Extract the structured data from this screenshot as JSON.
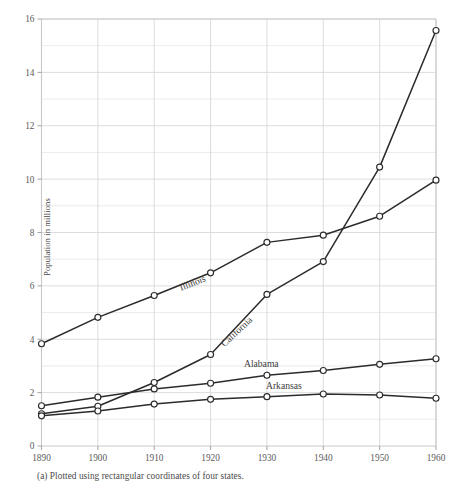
{
  "figure": {
    "caption": "(a)  Plotted using rectangular coordinates of four states.",
    "y_axis_title": "Population in millions"
  },
  "chart_data": {
    "type": "line",
    "title": "",
    "subtitle": "",
    "xlabel": "",
    "ylabel": "Population in millions",
    "x": [
      1890,
      1900,
      1910,
      1920,
      1930,
      1940,
      1950,
      1960
    ],
    "xtick_labels": [
      "1890",
      "1900",
      "1910",
      "1920",
      "1930",
      "1940",
      "1950",
      "1960"
    ],
    "ytick_labels": [
      "0",
      "2",
      "4",
      "6",
      "8",
      "10",
      "12",
      "14",
      "16"
    ],
    "ytick_values": [
      0,
      2,
      4,
      6,
      8,
      10,
      12,
      14,
      16
    ],
    "xlim": [
      1890,
      1960
    ],
    "ylim": [
      0,
      16
    ],
    "grid": true,
    "grid_minor_y_step": 1,
    "legend_position": "inline-labels",
    "markers": "open-circle",
    "series": [
      {
        "name": "Illinois",
        "label": "Illinois",
        "values": [
          3.83,
          4.82,
          5.64,
          6.49,
          7.63,
          7.9,
          8.61,
          9.96
        ]
      },
      {
        "name": "California",
        "label": "California",
        "values": [
          1.21,
          1.49,
          2.38,
          3.43,
          5.68,
          6.91,
          10.45,
          15.57
        ]
      },
      {
        "name": "Alabama",
        "label": "Alabama",
        "values": [
          1.51,
          1.83,
          2.14,
          2.35,
          2.65,
          2.83,
          3.06,
          3.27
        ]
      },
      {
        "name": "Arkansas",
        "label": "Arkansas",
        "values": [
          1.13,
          1.31,
          1.57,
          1.75,
          1.85,
          1.95,
          1.91,
          1.79
        ]
      }
    ],
    "annotations": [
      {
        "text": "Illinois",
        "x": 1917,
        "y": 6.0,
        "rotation": -21
      },
      {
        "text": "California",
        "x": 1925,
        "y": 4.2,
        "rotation": -43
      },
      {
        "text": "Alabama",
        "x": 1929,
        "y": 2.95,
        "rotation": 0
      },
      {
        "text": "Arkansas",
        "x": 1933,
        "y": 2.15,
        "rotation": 0
      }
    ]
  }
}
